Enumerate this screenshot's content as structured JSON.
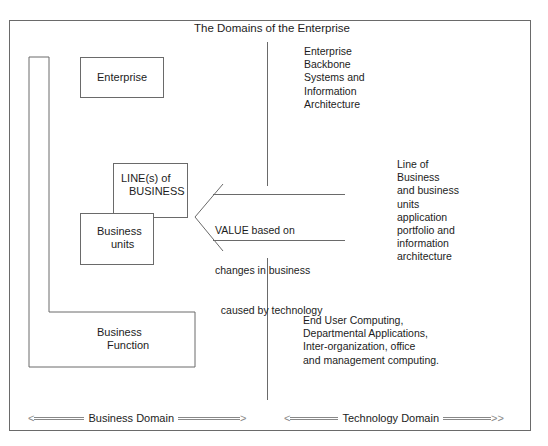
{
  "diagram": {
    "title": "The Domains of the Enterprise",
    "boxes": {
      "enterprise": "Enterprise",
      "lines_of_business": [
        "LINE(s) of",
        "BUSINESS"
      ],
      "business_units": [
        "Business",
        "units"
      ],
      "business_function": [
        "Business",
        "Function"
      ]
    },
    "value_arrow": {
      "direction": "left",
      "lines": [
        "VALUE based on",
        "changes in business",
        "  caused by technology"
      ]
    },
    "technology_descriptions": {
      "enterprise_backbone": "Enterprise\nBackbone\nSystems and\nInformation\nArchitecture",
      "line_of_business": "Line of\nBusiness\nand business\nunits\napplication\nportfolio and\ninformation\narchitecture",
      "end_user": "End User Computing,\nDepartmental Applications,\nInter-organization, office\nand management computing."
    },
    "domains": {
      "business": "Business Domain",
      "technology": "Technology Domain",
      "left_arrow": "<",
      "right_arrow": ">",
      "double_right_arrow": ">>"
    },
    "colors": {
      "line": "#6a6a6a",
      "text": "#1c1c1c"
    }
  }
}
